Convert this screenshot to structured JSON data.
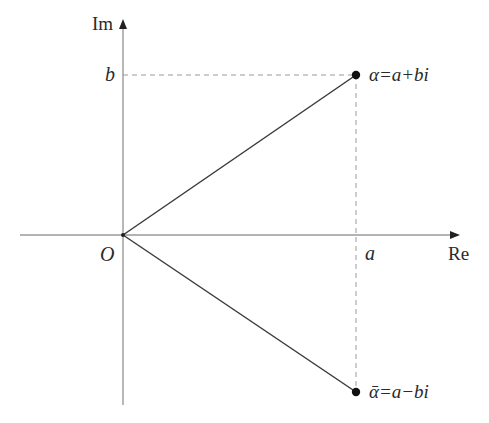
{
  "diagram": {
    "axes": {
      "real_label": "Re",
      "imag_label": "Im",
      "origin_label": "O"
    },
    "ticks": {
      "a_label": "a",
      "b_label": "b"
    },
    "points": [
      {
        "name": "alpha",
        "label": "α=a+bi",
        "coord": "(a, b)"
      },
      {
        "name": "alpha-bar",
        "label": "ᾱ=a−bi",
        "coord": "(a, −b)"
      }
    ],
    "colors": {
      "axis": "#9a9a9a",
      "segment": "#3a3a3a",
      "dashed": "#9a9a9a",
      "point": "#111111",
      "text": "#2a2a2a"
    }
  }
}
